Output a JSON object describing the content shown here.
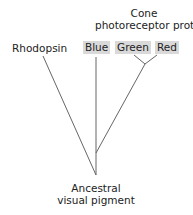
{
  "diagram": {
    "title_line1": "Cone",
    "title_line2": "photoreceptor proteins",
    "leaves": {
      "rhodopsin": "Rhodopsin",
      "blue": "Blue",
      "green": "Green",
      "red": "Red"
    },
    "root_line1": "Ancestral",
    "root_line2": "visual pigment",
    "colors": {
      "highlight": "#d9d9d9",
      "line": "#666666"
    }
  }
}
